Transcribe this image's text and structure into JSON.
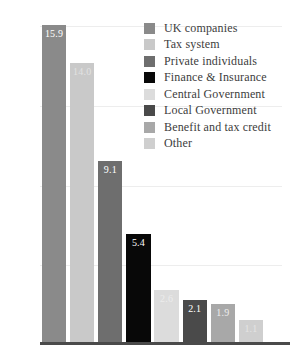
{
  "chart_data": {
    "type": "bar",
    "title": "",
    "subtitle": "",
    "xlabel": "",
    "ylabel": "",
    "ylim": [
      0,
      16
    ],
    "yticks": [
      0,
      4,
      8,
      12,
      16
    ],
    "ytick_labels": [
      "0",
      "4",
      "8",
      "12",
      "16"
    ],
    "grid": true,
    "grid_axis": "y",
    "legend_position": "top-right",
    "value_labels_inside_bars": true,
    "categories": [
      "UK companies",
      "Tax system",
      "Private individuals",
      "Finance & Insurance",
      "Central Government",
      "Local Government",
      "Benefit and tax credit",
      "Other"
    ],
    "values": [
      15.9,
      14.0,
      9.1,
      5.4,
      2.6,
      2.1,
      1.9,
      1.1
    ],
    "value_labels": [
      "15.9",
      "14.0",
      "9.1",
      "5.4",
      "2.6",
      "2.1",
      "1.9",
      "1.1"
    ],
    "colors": [
      "#8a8a8a",
      "#c9c9c9",
      "#6e6e6e",
      "#080808",
      "#dcdcdc",
      "#4a4a4a",
      "#a8a8a8",
      "#cfcfcf"
    ],
    "label_colors": [
      "#ffffff",
      "#e2e2e2",
      "#ffffff",
      "#ffffff",
      "#ececec",
      "#ffffff",
      "#ededed",
      "#e4e4e4"
    ],
    "legend": [
      {
        "label": "UK companies",
        "color": "#8a8a8a"
      },
      {
        "label": "Tax system",
        "color": "#c9c9c9"
      },
      {
        "label": "Private individuals",
        "color": "#6e6e6e"
      },
      {
        "label": "Finance & Insurance",
        "color": "#080808"
      },
      {
        "label": "Central Government",
        "color": "#dcdcdc"
      },
      {
        "label": "Local Government",
        "color": "#4a4a4a"
      },
      {
        "label": "Benefit and tax credit",
        "color": "#a8a8a8"
      },
      {
        "label": "Other",
        "color": "#cfcfcf"
      }
    ],
    "axis_color": "#4a4a4a",
    "gridline_color": "#ededed",
    "tick_text_color": "#5c5c5c"
  }
}
